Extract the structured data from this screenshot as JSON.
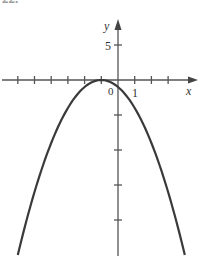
{
  "problem_label": "22.",
  "chart_data": {
    "type": "line",
    "title": "",
    "function": "y = -(x+1)^2",
    "xlabel": "x",
    "ylabel": "y",
    "origin_label": "0",
    "x_tick_label": "1",
    "y_tick_label": "5",
    "xlim": [
      -6,
      4.7
    ],
    "ylim": [
      -25,
      8.5
    ],
    "x_ticks": [
      -6,
      -5,
      -4,
      -3,
      -2,
      -1,
      1,
      2,
      3
    ],
    "y_ticks": [
      5,
      -5,
      -10,
      -15,
      -20
    ],
    "grid": false,
    "legend": "none",
    "vertex": [
      -1,
      0
    ],
    "x": [
      -6,
      -5,
      -4,
      -3,
      -2,
      -1,
      0,
      1,
      2,
      3,
      4
    ],
    "y": [
      -25,
      -16,
      -9,
      -4,
      -1,
      0,
      -1,
      -4,
      -9,
      -16,
      -25
    ],
    "colors": {
      "curve": "#3a3a3a",
      "axes": "#555555"
    }
  }
}
